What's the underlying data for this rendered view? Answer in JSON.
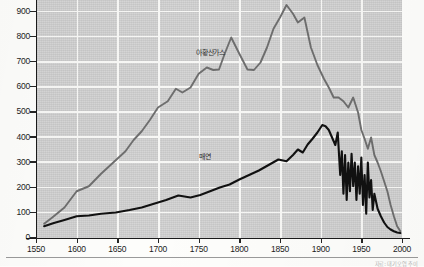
{
  "chart_data": {
    "type": "line",
    "title": "",
    "xlabel": "",
    "ylabel": "",
    "xlim": [
      1550,
      2000
    ],
    "ylim": [
      0,
      950
    ],
    "grid": true,
    "legend_position": "inline-annotations",
    "xticks": [
      1550,
      1600,
      1650,
      1700,
      1750,
      1800,
      1850,
      1900,
      1950,
      2000
    ],
    "yticks": [
      0,
      100,
      200,
      300,
      400,
      500,
      600,
      700,
      800,
      900
    ],
    "series": [
      {
        "name": "아황산가스",
        "color": "#6e6e6e",
        "label_x": 1765,
        "label_y": 745,
        "x": [
          1560,
          1570,
          1585,
          1600,
          1615,
          1630,
          1645,
          1660,
          1670,
          1680,
          1690,
          1700,
          1712,
          1722,
          1730,
          1740,
          1750,
          1760,
          1768,
          1775,
          1782,
          1790,
          1800,
          1810,
          1818,
          1826,
          1834,
          1842,
          1850,
          1858,
          1866,
          1872,
          1880,
          1888,
          1896,
          1904,
          1910,
          1916,
          1922,
          1928,
          1934,
          1940,
          1946,
          1950,
          1954,
          1958,
          1962,
          1966,
          1970,
          1974,
          1978,
          1982,
          1986,
          1990,
          1994,
          1998
        ],
        "y": [
          55,
          80,
          120,
          185,
          205,
          255,
          300,
          345,
          390,
          425,
          470,
          520,
          545,
          595,
          580,
          600,
          655,
          680,
          670,
          672,
          735,
          800,
          735,
          672,
          670,
          700,
          760,
          835,
          880,
          930,
          895,
          860,
          880,
          760,
          690,
          635,
          600,
          560,
          560,
          545,
          520,
          560,
          500,
          430,
          395,
          355,
          400,
          330,
          300,
          265,
          225,
          185,
          130,
          85,
          45,
          25
        ]
      },
      {
        "name": "매연",
        "color": "#111111",
        "label_x": 1757,
        "label_y": 330,
        "x": [
          1560,
          1572,
          1585,
          1600,
          1615,
          1630,
          1648,
          1665,
          1680,
          1695,
          1710,
          1725,
          1740,
          1752,
          1764,
          1776,
          1788,
          1800,
          1812,
          1824,
          1836,
          1848,
          1858,
          1866,
          1872,
          1878,
          1884,
          1890,
          1896,
          1902,
          1906,
          1910,
          1914,
          1918,
          1921,
          1924,
          1926,
          1928,
          1930,
          1932,
          1934,
          1936,
          1938,
          1940,
          1942,
          1944,
          1946,
          1948,
          1950,
          1952,
          1954,
          1956,
          1958,
          1960,
          1962,
          1964,
          1966,
          1970,
          1974,
          1978,
          1982,
          1986,
          1990,
          1994,
          1998
        ],
        "y": [
          45,
          58,
          70,
          85,
          88,
          95,
          100,
          110,
          120,
          135,
          150,
          168,
          160,
          170,
          185,
          200,
          212,
          232,
          250,
          268,
          290,
          312,
          305,
          330,
          352,
          340,
          372,
          395,
          420,
          450,
          445,
          430,
          400,
          370,
          420,
          250,
          345,
          175,
          330,
          150,
          300,
          185,
          335,
          205,
          300,
          150,
          285,
          175,
          320,
          130,
          250,
          95,
          300,
          160,
          230,
          110,
          175,
          115,
          85,
          60,
          42,
          32,
          25,
          20,
          18
        ]
      }
    ]
  },
  "axes": {
    "y_tick_labels": [
      "0",
      "100",
      "200",
      "300",
      "400",
      "500",
      "600",
      "700",
      "800",
      "900"
    ],
    "x_tick_labels": [
      "1550",
      "1600",
      "1650",
      "1700",
      "1750",
      "1800",
      "1850",
      "1900",
      "1950",
      "2000"
    ]
  },
  "caption": {
    "text": "자료: 대기오염 추이"
  }
}
